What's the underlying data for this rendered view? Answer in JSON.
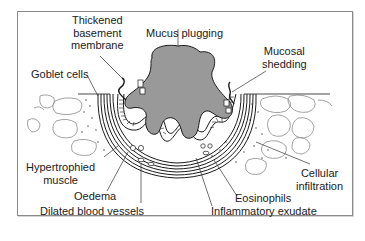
{
  "diagram": {
    "labels": {
      "thickened_basement_membrane": [
        "Thickened",
        "basement",
        "membrane"
      ],
      "mucus_plugging": "Mucus plugging",
      "mucosal_shedding": [
        "Mucosal",
        "shedding"
      ],
      "goblet_cells": "Goblet cells",
      "hypertrophied_muscle": [
        "Hypertrophied",
        "muscle"
      ],
      "oedema": "Oedema",
      "dilated_blood_vessels": "Dilated blood vessels",
      "cellular_infiltration": [
        "Cellular",
        "infiltration"
      ],
      "eosinophils": "Eosinophils",
      "inflammatory_exudate": "Inflammatory exudate"
    },
    "colors": {
      "mucus": "#999999",
      "line": "#1a1a1a",
      "frame": "#8a8a8a",
      "background": "#ffffff"
    }
  }
}
